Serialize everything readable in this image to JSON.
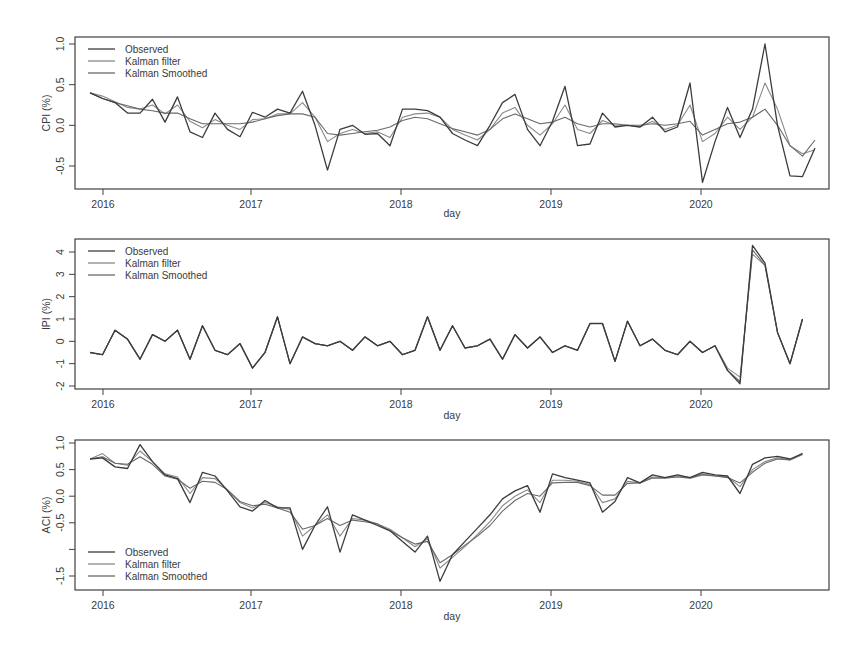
{
  "figure": {
    "x_start": "2015-12",
    "x_label": "day",
    "x_ticks": [
      "2016",
      "2017",
      "2018",
      "2019",
      "2020"
    ],
    "legend": [
      "Observed",
      "Kalman filter",
      "Kalman Smoothed"
    ],
    "colors": {
      "observed": "#3c3c3c",
      "filter": "#8a8a8a",
      "smoothed": "#6a6a6a",
      "frame": "#404040",
      "text": "#3a3a3a"
    }
  },
  "chart_data": [
    {
      "type": "line",
      "title": "",
      "xlabel": "day",
      "ylabel": "CPI (%)",
      "yticks": [
        "-0.5",
        "0.0",
        "0.5",
        "1.0"
      ],
      "ylim": [
        -0.78,
        1.05
      ],
      "legend_position": "top-left",
      "x": "monthly 2015-12 to 2020-09",
      "series": [
        {
          "name": "Observed",
          "values": [
            0.4,
            0.33,
            0.28,
            0.15,
            0.15,
            0.32,
            0.04,
            0.35,
            -0.08,
            -0.15,
            0.15,
            -0.05,
            -0.14,
            0.16,
            0.1,
            0.2,
            0.15,
            0.42,
            0.0,
            -0.55,
            -0.05,
            0.0,
            -0.11,
            -0.1,
            -0.25,
            0.2,
            0.2,
            0.18,
            0.1,
            -0.1,
            -0.18,
            -0.25,
            0.0,
            0.28,
            0.38,
            -0.05,
            -0.25,
            0.05,
            0.48,
            -0.25,
            -0.23,
            0.15,
            -0.02,
            0.0,
            -0.02,
            0.1,
            -0.08,
            -0.02,
            0.52,
            -0.7,
            -0.2,
            0.22,
            -0.15,
            0.2,
            1.0,
            0.0,
            -0.62,
            -0.63,
            -0.28
          ]
        },
        {
          "name": "Kalman filter",
          "values": [
            0.4,
            0.36,
            0.29,
            0.22,
            0.2,
            0.25,
            0.14,
            0.25,
            0.05,
            -0.03,
            0.07,
            0.0,
            -0.05,
            0.07,
            0.08,
            0.14,
            0.14,
            0.28,
            0.1,
            -0.2,
            -0.1,
            -0.05,
            -0.1,
            -0.08,
            -0.15,
            0.1,
            0.14,
            0.15,
            0.1,
            -0.05,
            -0.12,
            -0.18,
            -0.05,
            0.15,
            0.22,
            0.0,
            -0.12,
            0.02,
            0.25,
            -0.05,
            -0.1,
            0.06,
            0.0,
            0.0,
            -0.02,
            0.05,
            -0.05,
            0.0,
            0.25,
            -0.2,
            -0.1,
            0.1,
            -0.05,
            0.1,
            0.52,
            0.2,
            -0.25,
            -0.35,
            -0.3
          ]
        },
        {
          "name": "Kalman Smoothed",
          "values": [
            0.4,
            0.33,
            0.28,
            0.24,
            0.2,
            0.18,
            0.15,
            0.15,
            0.08,
            0.02,
            0.02,
            0.02,
            0.02,
            0.04,
            0.08,
            0.12,
            0.14,
            0.14,
            0.1,
            -0.1,
            -0.12,
            -0.1,
            -0.08,
            -0.06,
            -0.02,
            0.06,
            0.1,
            0.08,
            0.02,
            -0.04,
            -0.08,
            -0.12,
            -0.05,
            0.08,
            0.14,
            0.08,
            0.02,
            0.04,
            0.1,
            0.02,
            -0.02,
            0.02,
            0.02,
            0.0,
            0.0,
            0.02,
            0.0,
            0.02,
            0.05,
            -0.12,
            -0.05,
            0.02,
            0.04,
            0.1,
            0.2,
            0.0,
            -0.25,
            -0.38,
            -0.18
          ]
        }
      ]
    },
    {
      "type": "line",
      "title": "",
      "xlabel": "day",
      "ylabel": "IPI (%)",
      "yticks": [
        "-2",
        "-1",
        "0",
        "1",
        "2",
        "3",
        "4"
      ],
      "ylim": [
        -2.1,
        4.6
      ],
      "legend_position": "top-left",
      "x": "monthly 2015-12 to 2020-09",
      "series": [
        {
          "name": "Observed",
          "values": [
            -0.5,
            -0.6,
            0.5,
            0.1,
            -0.8,
            0.3,
            0.0,
            0.5,
            -0.8,
            0.7,
            -0.4,
            -0.6,
            -0.1,
            -1.2,
            -0.5,
            1.1,
            -1.0,
            0.2,
            -0.1,
            -0.2,
            0.0,
            -0.4,
            0.2,
            -0.2,
            0.0,
            -0.6,
            -0.4,
            1.1,
            -0.4,
            0.7,
            -0.3,
            -0.2,
            0.1,
            -0.8,
            0.3,
            -0.3,
            0.2,
            -0.5,
            -0.2,
            -0.4,
            0.8,
            0.8,
            -0.9,
            0.9,
            -0.2,
            0.1,
            -0.4,
            -0.6,
            0.0,
            -0.5,
            -0.2,
            -1.3,
            -1.9,
            4.3,
            3.5,
            0.4,
            -1.0,
            1.0
          ]
        },
        {
          "name": "Kalman filter",
          "values": [
            -0.5,
            -0.6,
            0.5,
            0.1,
            -0.8,
            0.3,
            0.0,
            0.5,
            -0.8,
            0.7,
            -0.4,
            -0.6,
            -0.1,
            -1.2,
            -0.5,
            1.1,
            -1.0,
            0.2,
            -0.1,
            -0.2,
            0.0,
            -0.4,
            0.2,
            -0.2,
            0.0,
            -0.6,
            -0.4,
            1.1,
            -0.4,
            0.7,
            -0.3,
            -0.2,
            0.1,
            -0.8,
            0.3,
            -0.3,
            0.2,
            -0.5,
            -0.2,
            -0.4,
            0.8,
            0.8,
            -0.9,
            0.9,
            -0.2,
            0.1,
            -0.4,
            -0.6,
            0.0,
            -0.5,
            -0.2,
            -1.2,
            -1.6,
            3.9,
            3.4,
            0.4,
            -1.0,
            1.0
          ]
        },
        {
          "name": "Kalman Smoothed",
          "values": [
            -0.5,
            -0.6,
            0.5,
            0.1,
            -0.8,
            0.3,
            0.0,
            0.5,
            -0.8,
            0.7,
            -0.4,
            -0.6,
            -0.1,
            -1.2,
            -0.5,
            1.1,
            -1.0,
            0.2,
            -0.1,
            -0.2,
            0.0,
            -0.4,
            0.2,
            -0.2,
            0.0,
            -0.6,
            -0.4,
            1.1,
            -0.4,
            0.7,
            -0.3,
            -0.2,
            0.1,
            -0.8,
            0.3,
            -0.3,
            0.2,
            -0.5,
            -0.2,
            -0.4,
            0.8,
            0.8,
            -0.9,
            0.9,
            -0.2,
            0.1,
            -0.4,
            -0.6,
            0.0,
            -0.5,
            -0.2,
            -1.3,
            -1.8,
            4.1,
            3.4,
            0.4,
            -1.0,
            1.0
          ]
        }
      ]
    },
    {
      "type": "line",
      "title": "",
      "xlabel": "day",
      "ylabel": "ACI (%)",
      "yticks": [
        "-1.5",
        "",
        "-0.5",
        "0.0",
        "0.5",
        "1.0"
      ],
      "ytick_values": [
        -1.5,
        -1.0,
        -0.5,
        0.0,
        0.5,
        1.0
      ],
      "ylim": [
        -1.85,
        1.1
      ],
      "legend_position": "bottom-left",
      "x": "monthly 2015-12 to 2020-09",
      "series": [
        {
          "name": "Observed",
          "values": [
            0.7,
            0.72,
            0.55,
            0.52,
            0.97,
            0.65,
            0.4,
            0.33,
            -0.12,
            0.45,
            0.38,
            0.1,
            -0.2,
            -0.28,
            -0.08,
            -0.22,
            -0.22,
            -1.0,
            -0.55,
            -0.2,
            -1.05,
            -0.35,
            -0.45,
            -0.55,
            -0.65,
            -0.85,
            -1.05,
            -0.75,
            -1.6,
            -1.1,
            -0.85,
            -0.6,
            -0.35,
            -0.05,
            0.1,
            0.2,
            -0.3,
            0.42,
            0.35,
            0.3,
            0.25,
            -0.3,
            -0.1,
            0.35,
            0.25,
            0.4,
            0.35,
            0.4,
            0.35,
            0.45,
            0.4,
            0.38,
            0.05,
            0.6,
            0.72,
            0.75,
            0.7,
            0.8
          ]
        },
        {
          "name": "Kalman filter",
          "values": [
            0.7,
            0.8,
            0.62,
            0.58,
            0.85,
            0.65,
            0.42,
            0.36,
            0.05,
            0.35,
            0.33,
            0.12,
            -0.12,
            -0.22,
            -0.12,
            -0.2,
            -0.25,
            -0.75,
            -0.55,
            -0.35,
            -0.75,
            -0.42,
            -0.45,
            -0.52,
            -0.62,
            -0.78,
            -0.95,
            -0.8,
            -1.35,
            -1.15,
            -0.95,
            -0.72,
            -0.48,
            -0.18,
            0.0,
            0.12,
            -0.12,
            0.3,
            0.3,
            0.28,
            0.22,
            -0.12,
            -0.05,
            0.28,
            0.25,
            0.36,
            0.35,
            0.38,
            0.35,
            0.42,
            0.38,
            0.36,
            0.18,
            0.5,
            0.65,
            0.72,
            0.68,
            0.78
          ]
        },
        {
          "name": "Kalman Smoothed",
          "values": [
            0.7,
            0.74,
            0.62,
            0.6,
            0.74,
            0.6,
            0.38,
            0.32,
            0.15,
            0.28,
            0.26,
            0.12,
            -0.1,
            -0.18,
            -0.15,
            -0.22,
            -0.3,
            -0.62,
            -0.55,
            -0.42,
            -0.55,
            -0.45,
            -0.48,
            -0.52,
            -0.65,
            -0.78,
            -0.9,
            -0.85,
            -1.25,
            -1.1,
            -0.92,
            -0.75,
            -0.55,
            -0.28,
            -0.08,
            0.05,
            0.0,
            0.25,
            0.26,
            0.26,
            0.2,
            0.02,
            0.02,
            0.24,
            0.25,
            0.34,
            0.34,
            0.36,
            0.34,
            0.4,
            0.38,
            0.35,
            0.25,
            0.45,
            0.62,
            0.7,
            0.68,
            0.8
          ]
        }
      ]
    }
  ]
}
